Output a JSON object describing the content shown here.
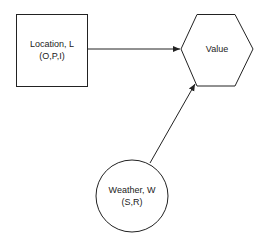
{
  "nodes": {
    "location": {
      "label": "Location, L",
      "states": "(O,P,I)",
      "shape": "rectangle"
    },
    "value": {
      "label": "Value",
      "shape": "hexagon"
    },
    "weather": {
      "label": "Weather, W",
      "states": "(S,R)",
      "shape": "circle"
    }
  },
  "edges": [
    {
      "from": "location",
      "to": "value"
    },
    {
      "from": "weather",
      "to": "value"
    }
  ],
  "colors": {
    "stroke": "#222222",
    "background": "#ffffff",
    "text": "#222222"
  }
}
